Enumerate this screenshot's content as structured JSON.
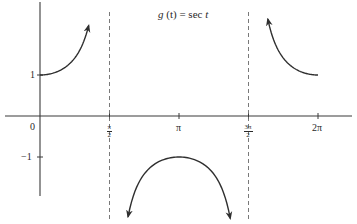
{
  "chart_data": {
    "type": "line",
    "title": "g (t) = sec t",
    "title_parts": {
      "fn": "g",
      "arg": "(t)",
      "eq": " = sec ",
      "var": "t"
    },
    "xlabel": "",
    "ylabel": "",
    "x_ticks": [
      {
        "label": "0",
        "value": 0
      },
      {
        "label": "π/2",
        "num": "π",
        "den": "2",
        "value": 1.5708
      },
      {
        "label": "π",
        "value": 3.1416
      },
      {
        "label": "3π/2",
        "num": "3π",
        "den": "2",
        "value": 4.7124
      },
      {
        "label": "2π",
        "value": 6.2832
      }
    ],
    "y_ticks": [
      {
        "label": "1",
        "value": 1
      },
      {
        "label": "−1",
        "value": -1
      }
    ],
    "xlim": [
      -0.6,
      6.8
    ],
    "ylim": [
      -1.95,
      2.8
    ],
    "asymptotes": [
      1.5708,
      4.7124
    ],
    "grid": false,
    "legend": "none",
    "series": [
      {
        "name": "sec t, 0 ≤ t < π/2",
        "x": [
          0,
          0.3,
          0.6,
          0.8,
          1.0,
          1.1
        ],
        "y": [
          1.0,
          1.047,
          1.212,
          1.435,
          1.851,
          2.2
        ],
        "arrow_end": true
      },
      {
        "name": "sec t, π/2 < t < 3π/2",
        "x": [
          1.99,
          2.3,
          2.6,
          2.9,
          3.1416,
          3.4,
          3.7,
          4.0,
          4.3
        ],
        "y": [
          -2.45,
          -1.5,
          -1.166,
          -1.03,
          -1.0,
          -1.034,
          -1.18,
          -1.53,
          -2.5
        ],
        "arrow_both": true
      },
      {
        "name": "sec t, 3π/2 < t ≤ 2π",
        "x": [
          5.15,
          5.4,
          5.7,
          6.0,
          6.2832
        ],
        "y": [
          2.35,
          1.58,
          1.2,
          1.04,
          1.0
        ],
        "arrow_start": true
      }
    ]
  },
  "colors": {
    "curve": "#2f2f2f",
    "axis": "#3a3a3a",
    "asymptote": "#6a6a6a",
    "text": "#2a2a2a",
    "background": "#ffffff"
  }
}
